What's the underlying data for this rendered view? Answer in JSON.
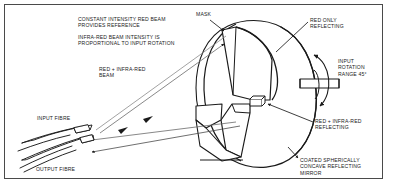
{
  "figure": {
    "frame_color": "#4a4a4a",
    "line_color": "#1a1a1a",
    "text_color": "#1a1a1a",
    "background": "#ffffff"
  },
  "labels": {
    "constant_intensity": "CONSTANT INTENSITY RED BEAM\nPROVIDES REFERENCE",
    "infrared_intensity": "INFRA-RED BEAM INTENSITY IS\nPROPORTIONAL TO INPUT ROTATION",
    "red_infrared_beam": "RED + INFRA-RED\nBEAM",
    "mask": "MASK",
    "red_only_reflecting": "RED ONLY\nREFLECTING",
    "input_rotation_range": "INPUT\nROTATION\nRANGE 45°",
    "red_infrared_reflecting": "RED + INFRA-RED\nREFLECTING",
    "coated_mirror": "COATED SPHERICALLY\nCONCAVE REFLECTING\nMIRROR",
    "input_fibre": "INPUT FIBRE",
    "output_fibre": "OUTPUT FIBRE"
  }
}
